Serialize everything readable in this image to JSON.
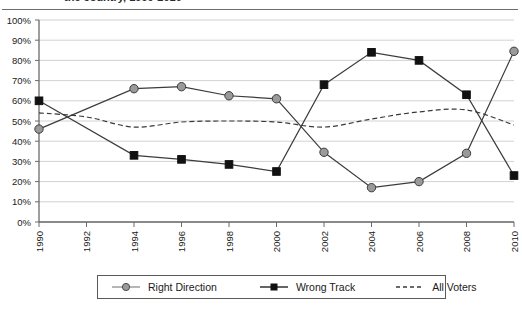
{
  "title": {
    "text_fragment": "the country, 1990-2010"
  },
  "legend": {
    "position": "bottom",
    "items": [
      {
        "label": "Right Direction",
        "marker": "circle",
        "color": "#8f8f8f",
        "style": "solid"
      },
      {
        "label": "Wrong Track",
        "marker": "square",
        "color": "#111111",
        "style": "solid"
      },
      {
        "label": "All Voters",
        "marker": "none",
        "color": "#3a3a3a",
        "style": "dashed"
      }
    ]
  },
  "axes": {
    "y_ticks": [
      "0%",
      "10%",
      "20%",
      "30%",
      "40%",
      "50%",
      "60%",
      "70%",
      "80%",
      "90%",
      "100%"
    ],
    "x_ticks": [
      "1990",
      "1992",
      "1994",
      "1996",
      "1998",
      "2000",
      "2002",
      "2004",
      "2006",
      "2008",
      "2010"
    ]
  },
  "chart_data": {
    "type": "line",
    "title": "the country, 1990-2010",
    "xlabel": "",
    "ylabel": "",
    "ylim": [
      0,
      100
    ],
    "xlim": [
      1990,
      2010
    ],
    "grid": "horizontal",
    "legend_position": "bottom",
    "x": [
      1990,
      1992,
      1994,
      1996,
      1998,
      2000,
      2002,
      2004,
      2006,
      2008,
      2010
    ],
    "categories": [
      "1990",
      "1992",
      "1994",
      "1996",
      "1998",
      "2000",
      "2002",
      "2004",
      "2006",
      "2008",
      "2010"
    ],
    "series": [
      {
        "name": "Right Direction",
        "marker": "circle",
        "color": "#8f8f8f",
        "style": "solid",
        "x": [
          1990,
          1994,
          1996,
          1998,
          2000,
          2002,
          2004,
          2006,
          2008,
          2010
        ],
        "values": [
          46,
          66,
          67,
          62.5,
          61,
          34.5,
          17,
          20,
          34,
          84.5
        ]
      },
      {
        "name": "Wrong Track",
        "marker": "square",
        "color": "#111111",
        "style": "solid",
        "x": [
          1990,
          1994,
          1996,
          1998,
          2000,
          2002,
          2004,
          2006,
          2008,
          2010
        ],
        "values": [
          60,
          33,
          31,
          28.5,
          25,
          68,
          84,
          80,
          63,
          23
        ]
      },
      {
        "name": "All Voters",
        "marker": "none",
        "color": "#3a3a3a",
        "style": "dashed",
        "x": [
          1990,
          1992,
          1994,
          1996,
          1998,
          2000,
          2002,
          2004,
          2006,
          2008,
          2010
        ],
        "values": [
          54,
          52,
          47,
          49.5,
          50,
          49.5,
          47,
          51,
          54.5,
          55.5,
          48
        ]
      }
    ]
  }
}
